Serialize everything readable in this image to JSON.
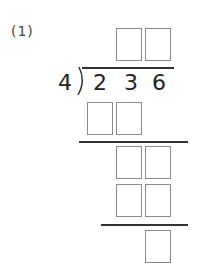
{
  "problem": {
    "label": "(1)",
    "divisor": "4",
    "dividend_digits": [
      "2",
      "3",
      "6"
    ]
  },
  "answer_boxes": {
    "quotient": 2,
    "row1": 2,
    "row2": 2,
    "row3": 2,
    "remainder": 1
  }
}
